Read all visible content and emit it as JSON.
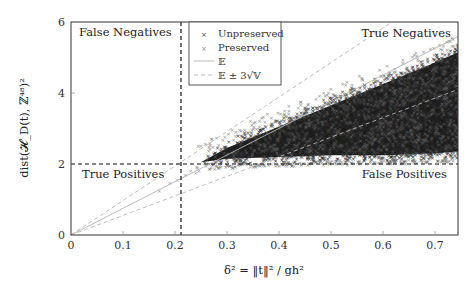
{
  "chart_data": {
    "type": "scatter",
    "title": "",
    "xlabel": "δ² = ‖t‖² / gh²",
    "ylabel": "dist(𝓗_D(t), ℤ⁴⁸)²",
    "xlim": [
      0,
      0.745
    ],
    "ylim": [
      0,
      6
    ],
    "x_ticks": [
      0,
      0.1,
      0.2,
      0.3,
      0.4,
      0.5,
      0.6,
      0.7
    ],
    "x_tick_labels": [
      "0",
      "0.1",
      "0.2",
      "0.3",
      "0.4",
      "0.5",
      "0.6",
      "0.7"
    ],
    "y_ticks": [
      0,
      2,
      4,
      6
    ],
    "y_tick_labels": [
      "0",
      "2",
      "4",
      "6"
    ],
    "grid": false,
    "legend_position": "upper-center",
    "legend": [
      {
        "label": "Unpreserved",
        "style": "marker-x",
        "color": "#3a3a3a"
      },
      {
        "label": "Preserved",
        "style": "marker-x",
        "color": "#8a8a8a"
      },
      {
        "label": "𝔼",
        "style": "solid-line",
        "color": "#b0b0b0"
      },
      {
        "label": "𝔼 ± 3√𝕍",
        "style": "dashed-line",
        "color": "#b0b0b0"
      }
    ],
    "series": [
      {
        "name": "𝔼",
        "type": "line",
        "slope": 7.5,
        "x": [
          0,
          0.745
        ],
        "y": [
          0,
          5.59
        ]
      },
      {
        "name": "𝔼 + 3√𝕍",
        "type": "line",
        "x": [
          0,
          0.2,
          0.4,
          0.613
        ],
        "y": [
          0,
          1.94,
          3.88,
          5.95
        ]
      },
      {
        "name": "𝔼 − 3√𝕍",
        "type": "line",
        "x": [
          0,
          0.2,
          0.4,
          0.745
        ],
        "y": [
          0,
          1.1,
          2.2,
          4.1
        ]
      },
      {
        "name": "Unpreserved",
        "type": "scatter",
        "note": "dense cloud",
        "envelope": {
          "x": [
            0.25,
            0.3,
            0.4,
            0.5,
            0.6,
            0.7,
            0.745
          ],
          "y_low": [
            1.9,
            2.0,
            2.05,
            2.1,
            2.1,
            2.15,
            2.2
          ],
          "y_high": [
            2.2,
            2.6,
            3.2,
            3.8,
            4.4,
            5.0,
            5.3
          ]
        }
      },
      {
        "name": "Preserved",
        "type": "scatter",
        "note": "sparse, concentrated near δ²≈0.15–0.35 and lower boundary",
        "sample_points": [
          [
            0.17,
            1.25
          ],
          [
            0.19,
            1.45
          ],
          [
            0.205,
            1.55
          ],
          [
            0.22,
            1.7
          ],
          [
            0.23,
            1.8
          ],
          [
            0.24,
            1.75
          ],
          [
            0.26,
            1.95
          ],
          [
            0.28,
            2.05
          ]
        ]
      }
    ],
    "thresholds": {
      "vertical_x": 0.212,
      "horizontal_y": 2.0
    },
    "annotations": [
      {
        "text": "False Negatives",
        "position": "top-left"
      },
      {
        "text": "True Negatives",
        "position": "top-right"
      },
      {
        "text": "True Positives",
        "position": "bottom-left"
      },
      {
        "text": "False Positives",
        "position": "bottom-right"
      }
    ]
  },
  "labels": {
    "false_negatives": "False Negatives",
    "true_negatives": "True Negatives",
    "true_positives": "True Positives",
    "false_positives": "False Positives",
    "legend_unpreserved": "Unpreserved",
    "legend_preserved": "Preserved",
    "legend_expectation": "𝔼",
    "legend_band": "𝔼 ± 3√𝕍",
    "x_tick_0": "0",
    "x_tick_1": "0.1",
    "x_tick_2": "0.2",
    "x_tick_3": "0.3",
    "x_tick_4": "0.4",
    "x_tick_5": "0.5",
    "x_tick_6": "0.6",
    "x_tick_7": "0.7",
    "y_tick_0": "0",
    "y_tick_2": "2",
    "y_tick_4": "4",
    "y_tick_6": "6"
  }
}
